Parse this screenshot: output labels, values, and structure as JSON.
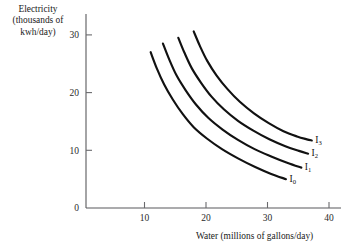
{
  "chart_data": {
    "type": "line",
    "title": "",
    "subtitle": "",
    "xlabel": "Water (millions of gallons/day)",
    "ylabel": "Electricity (thousands of kwh/day)",
    "ylabel_lines": [
      "Electricity",
      "(thousands of",
      "kwh/day)"
    ],
    "xlim": [
      0,
      42
    ],
    "ylim": [
      0,
      32
    ],
    "x_ticks": [
      10,
      20,
      30,
      40
    ],
    "y_ticks": [
      0,
      10,
      20,
      30
    ],
    "x_tick_labels": [
      "10",
      "20",
      "30",
      "40"
    ],
    "y_tick_labels": [
      "0",
      "10",
      "20",
      "30"
    ],
    "grid": false,
    "legend_position": "inline-right-end-of-curve",
    "annotations": [
      "I0",
      "I1",
      "I2",
      "I3"
    ],
    "series": [
      {
        "name": "I0",
        "label": "I",
        "label_subscript": "0",
        "x": [
          11.0,
          12.0,
          13.2,
          14.6,
          16.2,
          18.0,
          20.2,
          22.6,
          25.2,
          28.0,
          30.6,
          33.0
        ],
        "y": [
          27.0,
          24.2,
          21.4,
          18.8,
          16.3,
          14.0,
          12.0,
          10.2,
          8.6,
          7.1,
          5.9,
          5.0
        ]
      },
      {
        "name": "I1",
        "label": "I",
        "label_subscript": "1",
        "x": [
          13.0,
          14.0,
          15.2,
          16.7,
          18.4,
          20.4,
          22.7,
          25.2,
          27.9,
          30.7,
          33.3,
          35.5
        ],
        "y": [
          28.5,
          25.8,
          23.0,
          20.4,
          17.9,
          15.6,
          13.6,
          11.8,
          10.2,
          8.9,
          7.8,
          7.0
        ]
      },
      {
        "name": "I2",
        "label": "I",
        "label_subscript": "2",
        "x": [
          15.5,
          16.5,
          17.7,
          19.2,
          20.9,
          22.9,
          25.2,
          27.7,
          30.3,
          32.9,
          35.1,
          36.6
        ],
        "y": [
          29.5,
          26.9,
          24.2,
          21.7,
          19.3,
          17.1,
          15.1,
          13.4,
          11.9,
          10.7,
          9.9,
          9.4
        ]
      },
      {
        "name": "I3",
        "label": "I",
        "label_subscript": "3",
        "x": [
          18.0,
          19.0,
          20.2,
          21.7,
          23.5,
          25.5,
          27.8,
          30.2,
          32.6,
          34.8,
          36.4,
          37.2
        ],
        "y": [
          30.6,
          28.1,
          25.5,
          23.0,
          20.6,
          18.4,
          16.4,
          14.7,
          13.3,
          12.4,
          11.9,
          11.7
        ]
      }
    ],
    "colors": {
      "curve": "#111111",
      "axis": "#59595c",
      "text": "#1a1a1a",
      "background": "#ffffff"
    }
  },
  "curve_labels": [
    {
      "text": "I",
      "sub": "3"
    },
    {
      "text": "I",
      "sub": "2"
    },
    {
      "text": "I",
      "sub": "1"
    },
    {
      "text": "I",
      "sub": "0"
    }
  ]
}
